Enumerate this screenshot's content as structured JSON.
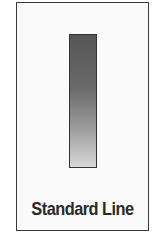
{
  "figure": {
    "label": "Standard Line",
    "bar": {
      "gradient_top": "#555555",
      "gradient_bottom": "#d8d8d8",
      "border_color": "#333333"
    },
    "frame": {
      "border_color": "#3a3a3a",
      "background": "#fafafa"
    }
  }
}
